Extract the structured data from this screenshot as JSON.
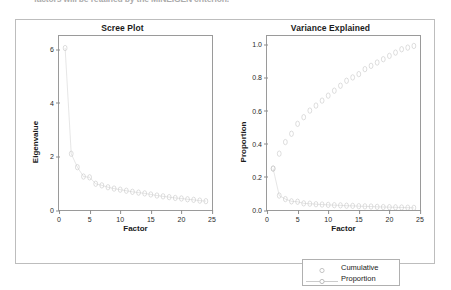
{
  "scan_text": "factors will be retained by the MINEIGEN criterion.",
  "figure": {
    "panel_border_color": "#bdbdbd",
    "marker_color": "#b9b9b9",
    "line_color": "#c3c3c3",
    "axis_color": "#9a9a9a"
  },
  "legend": {
    "entries": [
      {
        "label": "Cumulative",
        "style": "points"
      },
      {
        "label": "Proportion",
        "style": "line-points"
      }
    ]
  },
  "chart_data": [
    {
      "type": "scatter",
      "title": "Scree Plot",
      "xlabel": "Factor",
      "ylabel": "Eigenvalue",
      "xlim": [
        0,
        25
      ],
      "ylim": [
        0,
        6.5
      ],
      "xticks": [
        0,
        5,
        10,
        15,
        20,
        25
      ],
      "yticks": [
        0,
        2,
        4,
        6
      ],
      "grid": false,
      "legend_position": "none",
      "series": [
        {
          "name": "Eigenvalue",
          "x": [
            1,
            2,
            3,
            4,
            5,
            6,
            7,
            8,
            9,
            10,
            11,
            12,
            13,
            14,
            15,
            16,
            17,
            18,
            19,
            20,
            21,
            22,
            23,
            24
          ],
          "values": [
            6.05,
            2.1,
            1.6,
            1.25,
            1.22,
            0.98,
            0.92,
            0.85,
            0.8,
            0.76,
            0.72,
            0.68,
            0.65,
            0.62,
            0.58,
            0.54,
            0.51,
            0.48,
            0.45,
            0.43,
            0.4,
            0.38,
            0.35,
            0.33
          ]
        }
      ]
    },
    {
      "type": "scatter",
      "title": "Variance Explained",
      "xlabel": "Factor",
      "ylabel": "Proportion",
      "xlim": [
        0,
        25
      ],
      "ylim": [
        0.0,
        1.05
      ],
      "xticks": [
        0,
        5,
        10,
        15,
        20,
        25
      ],
      "yticks": [
        "0.0",
        "0.2",
        "0.4",
        "0.6",
        "0.8",
        "1.0"
      ],
      "grid": false,
      "legend_position": "bottom-right",
      "series": [
        {
          "name": "Cumulative",
          "x": [
            1,
            2,
            3,
            4,
            5,
            6,
            7,
            8,
            9,
            10,
            11,
            12,
            13,
            14,
            15,
            16,
            17,
            18,
            19,
            20,
            21,
            22,
            23,
            24
          ],
          "values": [
            0.25,
            0.34,
            0.41,
            0.46,
            0.52,
            0.56,
            0.6,
            0.63,
            0.66,
            0.69,
            0.72,
            0.75,
            0.78,
            0.8,
            0.82,
            0.85,
            0.87,
            0.89,
            0.91,
            0.93,
            0.95,
            0.97,
            0.98,
            0.99
          ]
        },
        {
          "name": "Proportion",
          "x": [
            1,
            2,
            3,
            4,
            5,
            6,
            7,
            8,
            9,
            10,
            11,
            12,
            13,
            14,
            15,
            16,
            17,
            18,
            19,
            20,
            21,
            22,
            23,
            24
          ],
          "values": [
            0.25,
            0.087,
            0.066,
            0.052,
            0.05,
            0.04,
            0.038,
            0.035,
            0.033,
            0.031,
            0.029,
            0.028,
            0.026,
            0.025,
            0.023,
            0.022,
            0.021,
            0.019,
            0.018,
            0.017,
            0.016,
            0.015,
            0.014,
            0.013
          ]
        }
      ]
    }
  ]
}
